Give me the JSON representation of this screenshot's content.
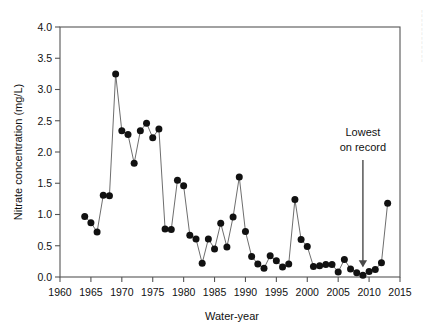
{
  "chart_data": {
    "type": "line",
    "title": "",
    "xlabel": "Water-year",
    "ylabel": "Nitrate concentration (mg/L)",
    "xlim": [
      1960,
      2015
    ],
    "ylim": [
      0.0,
      4.0
    ],
    "xticks": [
      1960,
      1965,
      1970,
      1975,
      1980,
      1985,
      1990,
      1995,
      2000,
      2005,
      2010,
      2015
    ],
    "yticks": [
      "0.0",
      "0.5",
      "1.0",
      "1.5",
      "2.0",
      "2.5",
      "3.0",
      "3.5",
      "4.0"
    ],
    "grid": false,
    "legend": null,
    "marker": "filled-circle",
    "marker_color": "#111111",
    "line_color": "#6e6e6e",
    "series": [
      {
        "name": "Nitrate concentration",
        "x": [
          1964,
          1965,
          1966,
          1967,
          1968,
          1969,
          1970,
          1971,
          1972,
          1973,
          1974,
          1975,
          1976,
          1977,
          1978,
          1979,
          1980,
          1981,
          1982,
          1983,
          1984,
          1985,
          1986,
          1987,
          1988,
          1989,
          1990,
          1991,
          1992,
          1993,
          1994,
          1995,
          1996,
          1997,
          1998,
          1999,
          2000,
          2001,
          2002,
          2003,
          2004,
          2005,
          2006,
          2007,
          2008,
          2009,
          2010,
          2011,
          2012,
          2013
        ],
        "values": [
          0.97,
          0.87,
          0.72,
          1.31,
          1.3,
          3.25,
          2.34,
          2.28,
          1.82,
          2.34,
          2.46,
          2.23,
          2.37,
          0.77,
          0.76,
          1.55,
          1.46,
          0.67,
          0.61,
          0.22,
          0.61,
          0.45,
          0.86,
          0.48,
          0.96,
          1.6,
          0.73,
          0.33,
          0.21,
          0.14,
          0.34,
          0.26,
          0.16,
          0.21,
          1.24,
          0.6,
          0.49,
          0.17,
          0.18,
          0.2,
          0.2,
          0.08,
          0.28,
          0.13,
          0.07,
          0.03,
          0.09,
          0.12,
          0.23,
          1.18
        ]
      }
    ],
    "annotations": [
      {
        "name": "lowest-on-record",
        "text_line1": "Lowest",
        "text_line2": "on record",
        "points_to_x": 2009,
        "points_to_y": 0.03
      }
    ]
  }
}
